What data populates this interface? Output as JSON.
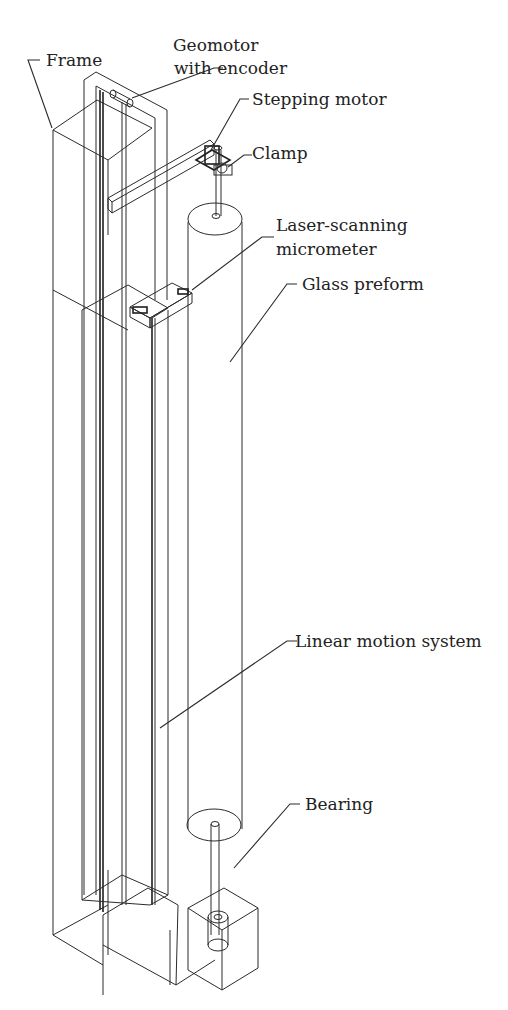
{
  "figure": {
    "type": "isometric wireframe apparatus diagram",
    "labels": {
      "frame": "Frame",
      "geomotor_line1": "Geomotor",
      "geomotor_line2": "with encoder",
      "stepping_motor": "Stepping motor",
      "clamp": "Clamp",
      "laser_line1": "Laser-scanning",
      "laser_line2": "micrometer",
      "glass_preform": "Glass preform",
      "linear_motion": "Linear motion system",
      "bearing": "Bearing"
    },
    "colors": {
      "background": "#ffffff",
      "line": "#2b2b2b",
      "text": "#222222"
    }
  }
}
